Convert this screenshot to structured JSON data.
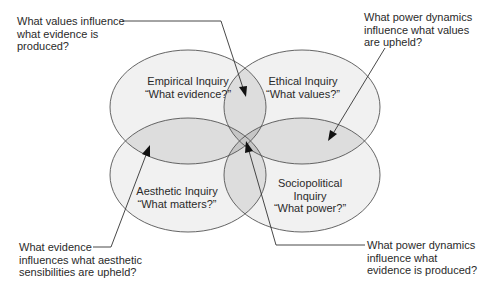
{
  "diagram": {
    "type": "four-ellipse overlapping Venn diagram",
    "fill_colors": {
      "single": "#f1f1f1",
      "pair": "#dddddd",
      "center": "#c6c6c6",
      "stroke": "#555555"
    },
    "ellipses": [
      {
        "id": "empirical",
        "title": "Empirical Inquiry",
        "question": "“What evidence?”"
      },
      {
        "id": "ethical",
        "title": "Ethical Inquiry",
        "question": "“What values?”"
      },
      {
        "id": "aesthetic",
        "title": "Aesthetic Inquiry",
        "question": "“What matters?”"
      },
      {
        "id": "sociopolitical",
        "title_line1": "Sociopolitical",
        "title_line2": "Inquiry",
        "question": "“What power?”"
      }
    ],
    "callouts": [
      {
        "id": "values-evidence",
        "lines": [
          "What values influence",
          "what evidence is",
          "produced?"
        ],
        "points_to": "Empirical ∩ Ethical"
      },
      {
        "id": "power-values",
        "lines": [
          "What power dynamics",
          "influence what values",
          "are upheld?"
        ],
        "points_to": "Ethical ∩ Sociopolitical"
      },
      {
        "id": "evidence-aesthetic",
        "lines": [
          "What evidence",
          "influences what aesthetic",
          "sensibilities are upheld?"
        ],
        "points_to": "Empirical ∩ Aesthetic"
      },
      {
        "id": "power-evidence",
        "lines": [
          "What power dynamics",
          "influence what",
          "evidence is produced?"
        ],
        "points_to": "Empirical ∩ Sociopolitical (center)"
      }
    ]
  }
}
